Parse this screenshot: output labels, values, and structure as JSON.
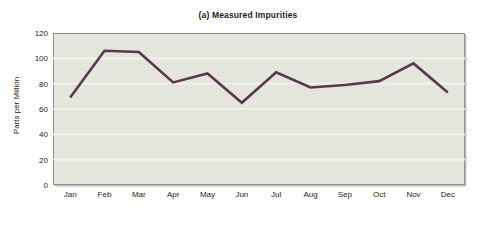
{
  "chart_data": {
    "type": "line",
    "title": "(a) Measured Impurities",
    "xlabel": "",
    "ylabel": "Parts per Million",
    "categories": [
      "Jan",
      "Feb",
      "Mar",
      "Apr",
      "May",
      "Jun",
      "Jul",
      "Aug",
      "Sep",
      "Oct",
      "Nov",
      "Dec"
    ],
    "values": [
      69,
      106,
      105,
      81,
      88,
      65,
      89,
      77,
      79,
      82,
      96,
      73
    ],
    "series": [
      {
        "name": "Measured Impurities",
        "values": [
          69,
          106,
          105,
          81,
          88,
          65,
          89,
          77,
          79,
          82,
          96,
          73
        ]
      }
    ],
    "ylim": [
      0,
      120
    ],
    "yticks": [
      0,
      20,
      40,
      60,
      80,
      100,
      120
    ],
    "ytick_labels": [
      "0",
      "20",
      "40",
      "60",
      "80",
      "100",
      "120"
    ],
    "grid": true,
    "grid_axis": "y",
    "legend": false,
    "legend_position": "none",
    "line_color": "#5a3852",
    "line_width": 2.6,
    "markers": false,
    "plot_background": "#e4e6dd",
    "figure_background": "#ffffff",
    "gridline_color": "#f2f3ee",
    "axis_color": "#8d8f88",
    "text_color": "#231f20"
  }
}
